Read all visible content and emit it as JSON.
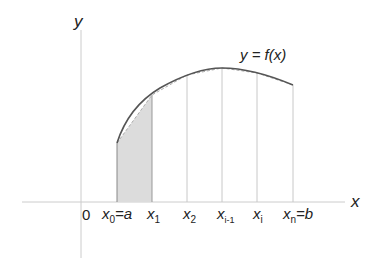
{
  "diagram": {
    "axes": {
      "x_label": "x",
      "y_label": "y",
      "origin_label": "0"
    },
    "curve_label": "y = f(x)",
    "partition_labels": [
      {
        "base": "x",
        "sub": "0",
        "suffix": "=a"
      },
      {
        "base": "x",
        "sub": "1",
        "suffix": ""
      },
      {
        "base": "x",
        "sub": "2",
        "suffix": ""
      },
      {
        "base": "x",
        "sub": "i-1",
        "suffix": ""
      },
      {
        "base": "x",
        "sub": "i",
        "suffix": ""
      },
      {
        "base": "x",
        "sub": "n",
        "suffix": "=b"
      }
    ],
    "shaded_region": "trapezoid between x0 and x1",
    "colors": {
      "curve": "#555555",
      "chord": "#aaaaaa",
      "axis": "#cccccc",
      "gridline": "#c8c8c8",
      "shade": "#dcdcdc"
    }
  }
}
